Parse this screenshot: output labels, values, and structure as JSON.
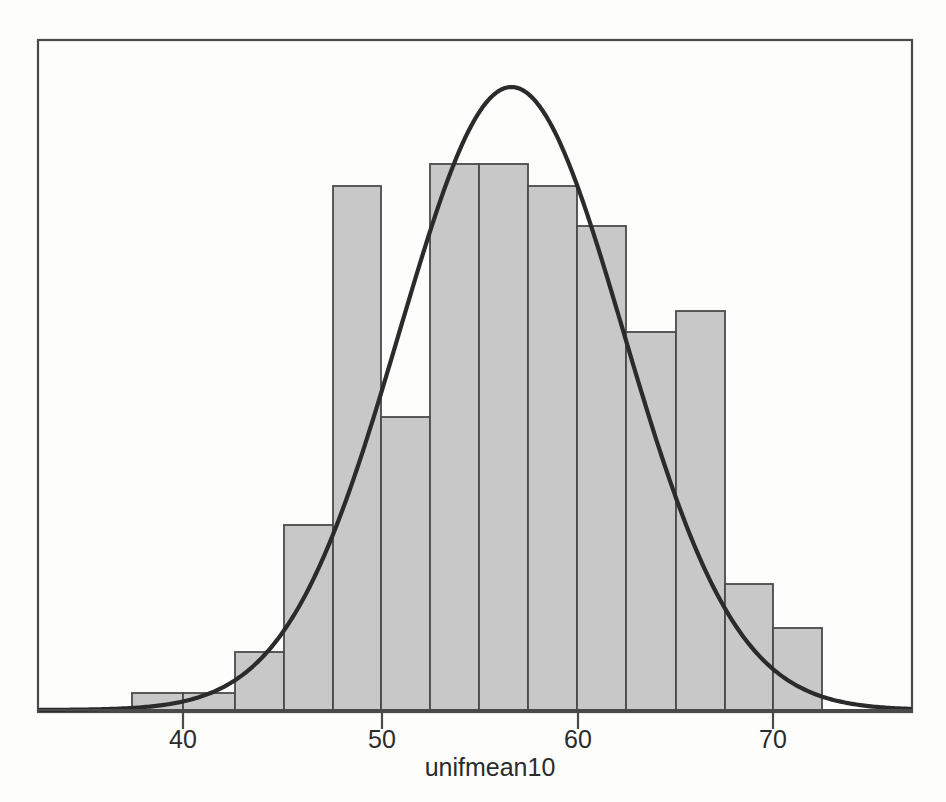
{
  "figure": {
    "background_color": "#fdfdfc",
    "frame": {
      "left": 38,
      "top": 40,
      "right": 912,
      "bottom": 712
    },
    "baseline_y": 710
  },
  "style": {
    "bar_fill": "#c8c8c8",
    "bar_stroke": "#4a4a4a",
    "curve_color": "#2b2b2b",
    "axis_color": "#4a4a4a",
    "text_color": "#2b2b2b"
  },
  "chart_data": {
    "type": "bar",
    "title": "",
    "subtitle": "",
    "xlabel": "unifmean10",
    "ylabel": "",
    "grid": false,
    "legend": null,
    "xlim": [
      33.8,
      78.0
    ],
    "ylim": [
      0,
      88
    ],
    "xticks": [
      40,
      50,
      60,
      70
    ],
    "xtick_labels": [
      "40",
      "50",
      "60",
      "70"
    ],
    "bin_width": 2.5,
    "bin_edges": [
      38.0,
      40.5,
      43.0,
      45.5,
      48.0,
      50.5,
      53.0,
      55.5,
      58.0,
      60.5,
      63.0,
      65.5,
      68.0,
      70.5,
      73.0
    ],
    "bin_centers": [
      39.25,
      41.75,
      44.25,
      46.75,
      49.25,
      51.75,
      54.25,
      56.75,
      59.25,
      61.75,
      64.25,
      66.75,
      69.25,
      71.75
    ],
    "counts": [
      2,
      2,
      8,
      24,
      69,
      38,
      72,
      72,
      69,
      63,
      49,
      52,
      16,
      11
    ],
    "bars_px": [
      {
        "x0": 132,
        "x1": 183,
        "top": 693,
        "count": 2,
        "bin": "38.0-40.5"
      },
      {
        "x0": 183,
        "x1": 235,
        "top": 693,
        "count": 2,
        "bin": "40.5-43.0"
      },
      {
        "x0": 235,
        "x1": 284,
        "top": 652,
        "count": 8,
        "bin": "43.0-45.5"
      },
      {
        "x0": 284,
        "x1": 333,
        "top": 525,
        "count": 24,
        "bin": "45.5-48.0"
      },
      {
        "x0": 333,
        "x1": 381,
        "top": 186,
        "count": 69,
        "bin": "48.0-50.5"
      },
      {
        "x0": 381,
        "x1": 430,
        "top": 417,
        "count": 38,
        "bin": "50.5-53.0"
      },
      {
        "x0": 430,
        "x1": 479,
        "top": 164,
        "count": 72,
        "bin": "53.0-55.5"
      },
      {
        "x0": 479,
        "x1": 528,
        "top": 164,
        "count": 72,
        "bin": "55.5-58.0"
      },
      {
        "x0": 528,
        "x1": 577,
        "top": 186,
        "count": 69,
        "bin": "58.0-60.5"
      },
      {
        "x0": 577,
        "x1": 626,
        "top": 226,
        "count": 63,
        "bin": "60.5-63.0"
      },
      {
        "x0": 626,
        "x1": 676,
        "top": 332,
        "count": 49,
        "bin": "63.0-65.5"
      },
      {
        "x0": 676,
        "x1": 725,
        "top": 311,
        "count": 52,
        "bin": "65.5-68.0"
      },
      {
        "x0": 725,
        "x1": 773,
        "top": 584,
        "count": 16,
        "bin": "68.0-70.5"
      },
      {
        "x0": 773,
        "x1": 822,
        "top": 628,
        "count": 11,
        "bin": "70.5-73.0"
      }
    ],
    "overlay_curve": {
      "kind": "normal-density",
      "mean": 56.7,
      "sd": 5.7,
      "peak_px": {
        "x": 512,
        "y": 87
      },
      "label": "normal curve overlay"
    }
  },
  "axis": {
    "x_title": "unifmean10",
    "x_title_px": {
      "x": 490,
      "y": 768
    },
    "ticks": [
      {
        "label": "40",
        "px": 183
      },
      {
        "label": "50",
        "px": 382
      },
      {
        "label": "60",
        "px": 578
      },
      {
        "label": "70",
        "px": 773
      }
    ],
    "tick_label_y": 748,
    "tick_mark_y0": 710,
    "tick_mark_y1": 729
  }
}
